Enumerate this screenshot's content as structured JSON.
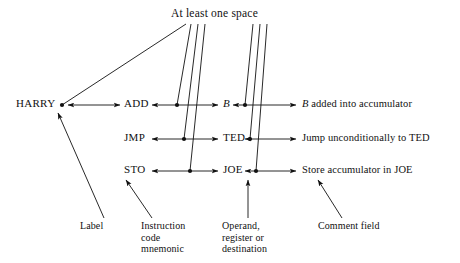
{
  "diagram": {
    "title": "At least one space",
    "rows": [
      {
        "label": "HARRY",
        "mnemonic": "ADD",
        "operand": "B",
        "comment_italic": "B",
        "comment_rest": " added into accumulator"
      },
      {
        "label": "",
        "mnemonic": "JMP",
        "operand": "TED",
        "comment_italic": "",
        "comment_rest": "Jump unconditionally to TED"
      },
      {
        "label": "",
        "mnemonic": "STO",
        "operand": "JOE",
        "comment_italic": "",
        "comment_rest": "Store accumulator in JOE"
      }
    ],
    "captions": [
      {
        "name": "label-caption",
        "lines": [
          "Label"
        ]
      },
      {
        "name": "instruction-caption",
        "lines": [
          "Instruction",
          "code",
          "mnemonic"
        ]
      },
      {
        "name": "operand-caption",
        "lines": [
          "Operand,",
          "register or",
          "destination"
        ]
      },
      {
        "name": "comment-caption",
        "lines": [
          "Comment field"
        ]
      }
    ],
    "colors": {
      "ink": "#111111",
      "background": "#ffffff"
    }
  }
}
